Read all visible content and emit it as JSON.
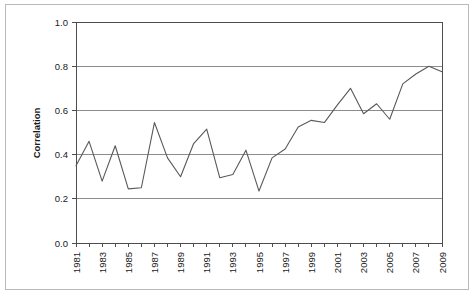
{
  "chart_data": {
    "type": "line",
    "title": "",
    "xlabel": "",
    "ylabel": "Correlation",
    "xlim": [
      1981,
      2009
    ],
    "ylim": [
      0.0,
      1.0
    ],
    "grid": true,
    "legend": "none",
    "y_ticks": [
      "0.0",
      "0.2",
      "0.4",
      "0.6",
      "0.8",
      "1.0"
    ],
    "y_tick_values": [
      0.0,
      0.2,
      0.4,
      0.6,
      0.8,
      1.0
    ],
    "x_ticks": [
      "1981",
      "1983",
      "1985",
      "1987",
      "1989",
      "1991",
      "1993",
      "1995",
      "1997",
      "1999",
      "2001",
      "2003",
      "2005",
      "2007",
      "2009"
    ],
    "x_tick_values": [
      1981,
      1983,
      1985,
      1987,
      1989,
      1991,
      1993,
      1995,
      1997,
      1999,
      2001,
      2003,
      2005,
      2007,
      2009
    ],
    "x": [
      1981,
      1982,
      1983,
      1984,
      1985,
      1986,
      1987,
      1988,
      1989,
      1990,
      1991,
      1992,
      1993,
      1994,
      1995,
      1996,
      1997,
      1998,
      1999,
      2000,
      2001,
      2002,
      2003,
      2004,
      2005,
      2006,
      2007,
      2008,
      2009
    ],
    "values": [
      0.35,
      0.46,
      0.28,
      0.44,
      0.245,
      0.25,
      0.545,
      0.385,
      0.3,
      0.45,
      0.515,
      0.295,
      0.31,
      0.42,
      0.235,
      0.385,
      0.425,
      0.525,
      0.555,
      0.545,
      0.625,
      0.7,
      0.585,
      0.63,
      0.56,
      0.72,
      0.765,
      0.8,
      0.775
    ],
    "series": [
      {
        "name": "Correlation",
        "color": "#595959",
        "values": [
          0.35,
          0.46,
          0.28,
          0.44,
          0.245,
          0.25,
          0.545,
          0.385,
          0.3,
          0.45,
          0.515,
          0.295,
          0.31,
          0.42,
          0.235,
          0.385,
          0.425,
          0.525,
          0.555,
          0.545,
          0.625,
          0.7,
          0.585,
          0.63,
          0.56,
          0.72,
          0.765,
          0.8,
          0.775
        ]
      }
    ]
  },
  "style": {
    "line_color": "#595959",
    "grid_color": "#8c8c8c",
    "axis_color": "#4d4d4d",
    "frame_color": "#b9b9b9",
    "background": "#ffffff",
    "text_color": "#1a1a1a"
  }
}
